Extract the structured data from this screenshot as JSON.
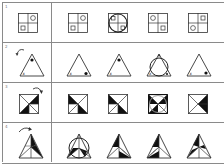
{
  "puzzle": {
    "rows": [
      {
        "label": "1",
        "reference": {
          "shape": "square-quadrants",
          "circle": "top-right",
          "square": "bottom-left"
        },
        "options": [
          {
            "shape": "square-quadrants",
            "circle": "top-right",
            "square": "bottom-left"
          },
          {
            "shape": "square-quadrants-with-circle-overlay",
            "marks": [
              "top-left",
              "bottom-right"
            ]
          },
          {
            "shape": "square-quadrants",
            "circle": "top-left",
            "square": "bottom-right"
          },
          {
            "shape": "square-quadrants",
            "square": "top-right",
            "circle": "bottom-left"
          }
        ]
      },
      {
        "label": "2",
        "reference": {
          "shape": "triangle",
          "dot": "top",
          "x_mark": "bottom-left",
          "rotation_arrow": "counterclockwise"
        },
        "options": [
          {
            "shape": "triangle",
            "x_mark": "bottom-left",
            "dot": "bottom-right"
          },
          {
            "shape": "triangle",
            "dot": "top",
            "x_mark": "bottom-left"
          },
          {
            "shape": "triangle-with-circle-overlay"
          },
          {
            "shape": "triangle",
            "x_mark": "bottom-left",
            "dot": "bottom-right"
          }
        ]
      },
      {
        "label": "3",
        "reference": {
          "shape": "square-diagonals",
          "filled": [
            "top-right-upper",
            "bottom-left-lower"
          ],
          "rotation_arrow": "clockwise"
        },
        "options": [
          {
            "shape": "square-diagonals",
            "filled": [
              "top-left",
              "bottom-right"
            ]
          },
          {
            "shape": "square-diagonals",
            "filled": [
              "top-left",
              "bottom-right"
            ]
          },
          {
            "shape": "square-diagonals-with-circle-overlay"
          },
          {
            "shape": "square-diagonals",
            "filled": [
              "top-right",
              "bottom-right-inner"
            ]
          }
        ]
      },
      {
        "label": "4",
        "reference": {
          "shape": "triangle-segments",
          "filled": [
            "right-upper",
            "right-lower"
          ],
          "rotation_arrow": "clockwise"
        },
        "options": [
          {
            "shape": "triangle-segments-with-circle-overlay"
          },
          {
            "shape": "triangle-segments",
            "filled": [
              "top-left",
              "bottom-right"
            ]
          },
          {
            "shape": "triangle-segments",
            "filled": [
              "top-left",
              "bottom-left"
            ]
          },
          {
            "shape": "triangle-segments",
            "filled": [
              "top-left",
              "left-lower"
            ]
          }
        ]
      }
    ]
  }
}
